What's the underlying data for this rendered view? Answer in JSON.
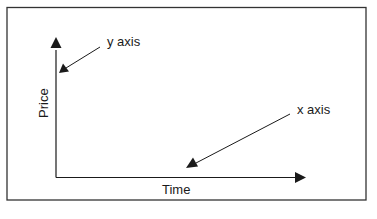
{
  "diagram": {
    "type": "axes-illustration",
    "labels": {
      "y_axis_callout": "y axis",
      "x_axis_callout": "x axis",
      "x_axis_title": "Time",
      "y_axis_title": "Price"
    },
    "colors": {
      "line": "#1a1a1a",
      "frame": "#333333",
      "background": "#ffffff"
    }
  }
}
